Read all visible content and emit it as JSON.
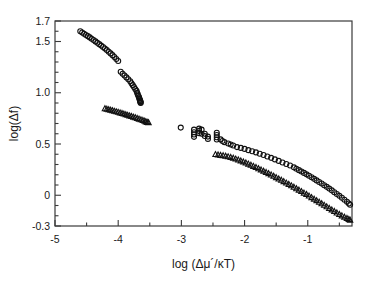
{
  "figure": {
    "background_color": "#ffffff",
    "frame_color": "#3a3a3a",
    "marker_color": "#111111"
  },
  "chart_data": {
    "type": "scatter",
    "title": "",
    "xlabel": "log (Δμ´/κT)",
    "ylabel": "log(Δf)",
    "xlim": [
      -5,
      -0.3
    ],
    "ylim": [
      -0.3,
      1.7
    ],
    "xticks": [
      -5,
      -4,
      -3,
      -2,
      -1
    ],
    "xticklabels": [
      "-5",
      "-4",
      "-3",
      "-2",
      "-1"
    ],
    "xminor_step": 0.5,
    "yticks": [
      1.7,
      1.5,
      1.0,
      0.5,
      0,
      -0.3
    ],
    "yticklabels": [
      "1.7",
      "1.5",
      "1.0",
      "0.5",
      "0",
      "-0.3"
    ],
    "yminor_step": 0.1,
    "grid": false,
    "legend": "none",
    "series": [
      {
        "name": "circles-branch-1",
        "marker": "open-circle",
        "points": [
          [
            -4.6,
            1.6
          ],
          [
            -4.57,
            1.588
          ],
          [
            -4.54,
            1.576
          ],
          [
            -4.51,
            1.564
          ],
          [
            -4.48,
            1.552
          ],
          [
            -4.45,
            1.54
          ],
          [
            -4.42,
            1.527
          ],
          [
            -4.39,
            1.514
          ],
          [
            -4.36,
            1.501
          ],
          [
            -4.33,
            1.488
          ],
          [
            -4.3,
            1.474
          ],
          [
            -4.27,
            1.46
          ],
          [
            -4.24,
            1.446
          ],
          [
            -4.21,
            1.431
          ],
          [
            -4.18,
            1.416
          ],
          [
            -4.15,
            1.4
          ],
          [
            -4.12,
            1.384
          ],
          [
            -4.09,
            1.367
          ],
          [
            -4.06,
            1.349
          ],
          [
            -4.03,
            1.33
          ],
          [
            -4.0,
            1.31
          ]
        ]
      },
      {
        "name": "circles-branch-2",
        "marker": "open-circle",
        "points": [
          [
            -3.96,
            1.205
          ],
          [
            -3.93,
            1.186
          ],
          [
            -3.9,
            1.168
          ],
          [
            -3.87,
            1.15
          ],
          [
            -3.84,
            1.131
          ],
          [
            -3.81,
            1.112
          ],
          [
            -3.79,
            1.093
          ],
          [
            -3.77,
            1.074
          ],
          [
            -3.75,
            1.055
          ],
          [
            -3.73,
            1.036
          ],
          [
            -3.71,
            1.018
          ],
          [
            -3.7,
            1.0
          ],
          [
            -3.69,
            0.984
          ],
          [
            -3.68,
            0.968
          ],
          [
            -3.67,
            0.955
          ],
          [
            -3.665,
            0.944
          ],
          [
            -3.66,
            0.934
          ],
          [
            -3.655,
            0.926
          ],
          [
            -3.65,
            0.918
          ],
          [
            -3.648,
            0.912
          ],
          [
            -3.646,
            0.906
          ],
          [
            -3.644,
            0.901
          ]
        ]
      },
      {
        "name": "triangles-branch-1",
        "marker": "open-triangle",
        "points": [
          [
            -4.21,
            0.845
          ],
          [
            -4.18,
            0.84
          ],
          [
            -4.15,
            0.835
          ],
          [
            -4.12,
            0.83
          ],
          [
            -4.09,
            0.825
          ],
          [
            -4.06,
            0.82
          ],
          [
            -4.03,
            0.815
          ],
          [
            -4.0,
            0.81
          ],
          [
            -3.97,
            0.804
          ],
          [
            -3.94,
            0.799
          ],
          [
            -3.91,
            0.793
          ],
          [
            -3.88,
            0.787
          ],
          [
            -3.85,
            0.781
          ],
          [
            -3.82,
            0.775
          ],
          [
            -3.79,
            0.769
          ],
          [
            -3.76,
            0.763
          ],
          [
            -3.73,
            0.757
          ],
          [
            -3.7,
            0.75
          ],
          [
            -3.67,
            0.744
          ],
          [
            -3.64,
            0.737
          ],
          [
            -3.61,
            0.73
          ],
          [
            -3.58,
            0.723
          ],
          [
            -3.56,
            0.717
          ],
          [
            -3.54,
            0.712
          ],
          [
            -3.52,
            0.708
          ]
        ]
      },
      {
        "name": "circles-main",
        "marker": "open-circle",
        "points": [
          [
            -3.01,
            0.66
          ],
          [
            -2.8,
            0.64
          ],
          [
            -2.8,
            0.615
          ],
          [
            -2.8,
            0.592
          ],
          [
            -2.8,
            0.57
          ],
          [
            -2.72,
            0.65
          ],
          [
            -2.72,
            0.628
          ],
          [
            -2.72,
            0.606
          ],
          [
            -2.68,
            0.64
          ],
          [
            -2.68,
            0.6
          ],
          [
            -2.63,
            0.6
          ],
          [
            -2.63,
            0.578
          ],
          [
            -2.58,
            0.572
          ],
          [
            -2.58,
            0.55
          ],
          [
            -2.44,
            0.61
          ],
          [
            -2.44,
            0.588
          ],
          [
            -2.44,
            0.566
          ],
          [
            -2.44,
            0.544
          ],
          [
            -2.38,
            0.545
          ],
          [
            -2.35,
            0.53
          ],
          [
            -2.32,
            0.518
          ],
          [
            -2.26,
            0.505
          ],
          [
            -2.22,
            0.495
          ],
          [
            -2.18,
            0.485
          ],
          [
            -2.12,
            0.47
          ],
          [
            -2.06,
            0.462
          ],
          [
            -2.0,
            0.452
          ],
          [
            -1.94,
            0.44
          ],
          [
            -1.88,
            0.43
          ],
          [
            -1.82,
            0.418
          ],
          [
            -1.76,
            0.405
          ],
          [
            -1.7,
            0.392
          ],
          [
            -1.64,
            0.378
          ],
          [
            -1.58,
            0.365
          ],
          [
            -1.52,
            0.35
          ],
          [
            -1.46,
            0.335
          ],
          [
            -1.4,
            0.32
          ],
          [
            -1.34,
            0.305
          ],
          [
            -1.28,
            0.29
          ],
          [
            -1.22,
            0.272
          ],
          [
            -1.18,
            0.258
          ],
          [
            -1.14,
            0.245
          ],
          [
            -1.1,
            0.232
          ],
          [
            -1.06,
            0.218
          ],
          [
            -1.02,
            0.204
          ],
          [
            -0.98,
            0.19
          ],
          [
            -0.94,
            0.175
          ],
          [
            -0.9,
            0.16
          ],
          [
            -0.86,
            0.145
          ],
          [
            -0.82,
            0.13
          ],
          [
            -0.78,
            0.115
          ],
          [
            -0.74,
            0.098
          ],
          [
            -0.7,
            0.082
          ],
          [
            -0.66,
            0.065
          ],
          [
            -0.62,
            0.048
          ],
          [
            -0.58,
            0.03
          ],
          [
            -0.54,
            0.012
          ],
          [
            -0.5,
            -0.006
          ],
          [
            -0.46,
            -0.025
          ],
          [
            -0.42,
            -0.044
          ],
          [
            -0.38,
            -0.064
          ],
          [
            -0.35,
            -0.08
          ],
          [
            -0.33,
            -0.092
          ]
        ]
      },
      {
        "name": "triangles-main",
        "marker": "open-triangle",
        "points": [
          [
            -2.46,
            0.398
          ],
          [
            -2.42,
            0.394
          ],
          [
            -2.38,
            0.39
          ],
          [
            -2.34,
            0.386
          ],
          [
            -2.3,
            0.382
          ],
          [
            -2.26,
            0.376
          ],
          [
            -2.22,
            0.37
          ],
          [
            -2.18,
            0.362
          ],
          [
            -2.14,
            0.354
          ],
          [
            -2.1,
            0.345
          ],
          [
            -2.06,
            0.336
          ],
          [
            -2.02,
            0.326
          ],
          [
            -1.98,
            0.316
          ],
          [
            -1.94,
            0.305
          ],
          [
            -1.9,
            0.294
          ],
          [
            -1.86,
            0.283
          ],
          [
            -1.82,
            0.272
          ],
          [
            -1.78,
            0.26
          ],
          [
            -1.74,
            0.248
          ],
          [
            -1.7,
            0.236
          ],
          [
            -1.66,
            0.224
          ],
          [
            -1.62,
            0.212
          ],
          [
            -1.58,
            0.199
          ],
          [
            -1.54,
            0.186
          ],
          [
            -1.5,
            0.173
          ],
          [
            -1.46,
            0.16
          ],
          [
            -1.42,
            0.147
          ],
          [
            -1.38,
            0.134
          ],
          [
            -1.34,
            0.12
          ],
          [
            -1.3,
            0.107
          ],
          [
            -1.26,
            0.093
          ],
          [
            -1.22,
            0.079
          ],
          [
            -1.18,
            0.065
          ],
          [
            -1.14,
            0.051
          ],
          [
            -1.1,
            0.037
          ],
          [
            -1.06,
            0.022
          ],
          [
            -1.02,
            0.008
          ],
          [
            -0.98,
            -0.007
          ],
          [
            -0.94,
            -0.022
          ],
          [
            -0.9,
            -0.037
          ],
          [
            -0.86,
            -0.052
          ],
          [
            -0.82,
            -0.067
          ],
          [
            -0.78,
            -0.082
          ],
          [
            -0.74,
            -0.097
          ],
          [
            -0.7,
            -0.112
          ],
          [
            -0.66,
            -0.127
          ],
          [
            -0.62,
            -0.142
          ],
          [
            -0.58,
            -0.157
          ],
          [
            -0.54,
            -0.172
          ],
          [
            -0.5,
            -0.187
          ],
          [
            -0.46,
            -0.2
          ],
          [
            -0.42,
            -0.213
          ],
          [
            -0.38,
            -0.226
          ],
          [
            -0.35,
            -0.235
          ],
          [
            -0.33,
            -0.242
          ]
        ]
      }
    ]
  }
}
